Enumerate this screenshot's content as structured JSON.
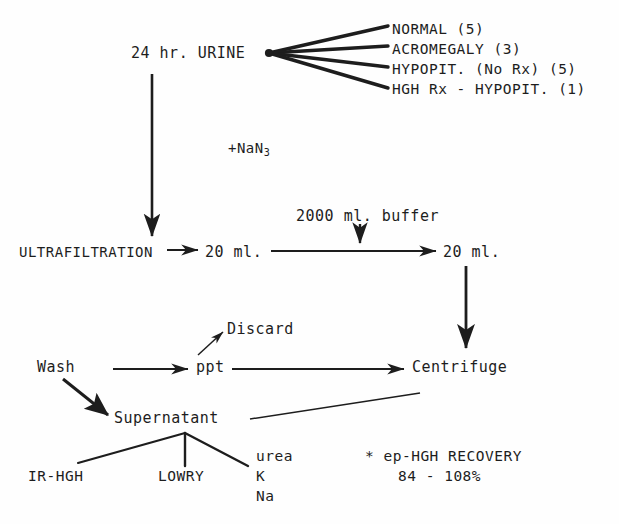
{
  "diagram": {
    "nodes": {
      "urine": "24 hr. URINE",
      "preservative_prefix": "+NaN",
      "preservative_subscript": "3",
      "ultrafiltration": "ULTRAFILTRATION",
      "volume_a": "20 ml.",
      "buffer": "2000 ml. buffer",
      "volume_b": "20 ml.",
      "discard": "Discard",
      "wash": "Wash",
      "ppt": "ppt",
      "centrifuge": "Centrifuge",
      "supernatant": "Supernatant",
      "assay_irhgh": "IR-HGH",
      "assay_lowry": "LOWRY",
      "assay_urea": "urea",
      "assay_k": "K",
      "assay_na": "Na"
    },
    "groups": [
      {
        "label": "NORMAL (5)"
      },
      {
        "label": "ACROMEGALY (3)"
      },
      {
        "label": "HYPOPIT. (No Rx) (5)"
      },
      {
        "label": "HGH Rx - HYPOPIT. (1)"
      }
    ],
    "note": {
      "line1": "* ep-HGH RECOVERY",
      "line2": "84 - 108%"
    },
    "colors": {
      "ink": "#1d1d1d",
      "paper": "#fefefe"
    }
  }
}
